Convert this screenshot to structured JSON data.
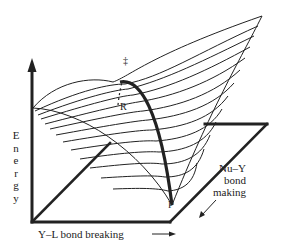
{
  "figure": {
    "type": "potential-energy-surface",
    "axes": {
      "vertical": {
        "label": "Energy",
        "letters": [
          "E",
          "n",
          "e",
          "r",
          "g",
          "y"
        ]
      },
      "horizontal": {
        "label": "Y–L bond breaking",
        "arrow": "right"
      },
      "depth": {
        "label_lines": [
          "Nu–Y",
          "bond",
          "making"
        ],
        "arrow": "down-left"
      }
    },
    "points": {
      "transition_state": "‡",
      "reactant": "R",
      "product": "P"
    },
    "colors": {
      "line": "#222222",
      "background": "#ffffff"
    }
  }
}
